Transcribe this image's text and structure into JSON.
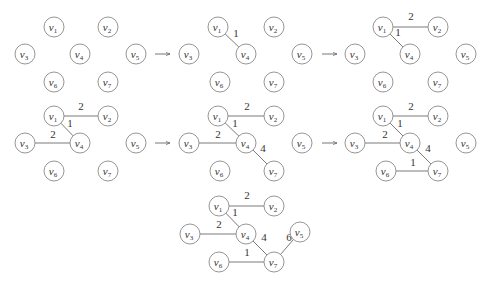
{
  "colors": {
    "node_stroke": "#8a8a8a",
    "edge": "#7a7a7a",
    "text": "#333333"
  },
  "node_radius": 10,
  "panels": [
    {
      "id": "step-1",
      "nodes": [
        {
          "id": "v1",
          "label": "v",
          "sub": "1",
          "x": 54,
          "y": 27
        },
        {
          "id": "v2",
          "label": "v",
          "sub": "2",
          "x": 108,
          "y": 27
        },
        {
          "id": "v3",
          "label": "v",
          "sub": "3",
          "x": 25,
          "y": 54
        },
        {
          "id": "v4",
          "label": "v",
          "sub": "4",
          "x": 80,
          "y": 54
        },
        {
          "id": "v5",
          "label": "v",
          "sub": "5",
          "x": 136,
          "y": 54
        },
        {
          "id": "v6",
          "label": "v",
          "sub": "6",
          "x": 54,
          "y": 82
        },
        {
          "id": "v7",
          "label": "v",
          "sub": "7",
          "x": 108,
          "y": 82
        }
      ],
      "edges": []
    },
    {
      "id": "step-2",
      "nodes": [
        {
          "id": "v1",
          "label": "v",
          "sub": "1",
          "x": 218,
          "y": 27
        },
        {
          "id": "v2",
          "label": "v",
          "sub": "2",
          "x": 274,
          "y": 27
        },
        {
          "id": "v3",
          "label": "v",
          "sub": "3",
          "x": 189,
          "y": 54
        },
        {
          "id": "v4",
          "label": "v",
          "sub": "4",
          "x": 246,
          "y": 54
        },
        {
          "id": "v5",
          "label": "v",
          "sub": "5",
          "x": 302,
          "y": 54
        },
        {
          "id": "v6",
          "label": "v",
          "sub": "6",
          "x": 220,
          "y": 82
        },
        {
          "id": "v7",
          "label": "v",
          "sub": "7",
          "x": 274,
          "y": 82
        }
      ],
      "edges": [
        {
          "from": "v1",
          "to": "v4",
          "weight": "1",
          "lx": 236,
          "ly": 37
        }
      ]
    },
    {
      "id": "step-3",
      "nodes": [
        {
          "id": "v1",
          "label": "v",
          "sub": "1",
          "x": 383,
          "y": 27
        },
        {
          "id": "v2",
          "label": "v",
          "sub": "2",
          "x": 438,
          "y": 27
        },
        {
          "id": "v3",
          "label": "v",
          "sub": "3",
          "x": 355,
          "y": 54
        },
        {
          "id": "v4",
          "label": "v",
          "sub": "4",
          "x": 410,
          "y": 54
        },
        {
          "id": "v5",
          "label": "v",
          "sub": "5",
          "x": 466,
          "y": 54
        },
        {
          "id": "v6",
          "label": "v",
          "sub": "6",
          "x": 383,
          "y": 82
        },
        {
          "id": "v7",
          "label": "v",
          "sub": "7",
          "x": 438,
          "y": 82
        }
      ],
      "edges": [
        {
          "from": "v1",
          "to": "v2",
          "weight": "2",
          "lx": 411,
          "ly": 20
        },
        {
          "from": "v1",
          "to": "v4",
          "weight": "1",
          "lx": 398,
          "ly": 36
        }
      ]
    },
    {
      "id": "step-4",
      "nodes": [
        {
          "id": "v1",
          "label": "v",
          "sub": "1",
          "x": 54,
          "y": 116
        },
        {
          "id": "v2",
          "label": "v",
          "sub": "2",
          "x": 108,
          "y": 116
        },
        {
          "id": "v3",
          "label": "v",
          "sub": "3",
          "x": 25,
          "y": 143
        },
        {
          "id": "v4",
          "label": "v",
          "sub": "4",
          "x": 80,
          "y": 143
        },
        {
          "id": "v5",
          "label": "v",
          "sub": "5",
          "x": 136,
          "y": 143
        },
        {
          "id": "v6",
          "label": "v",
          "sub": "6",
          "x": 54,
          "y": 171
        },
        {
          "id": "v7",
          "label": "v",
          "sub": "7",
          "x": 108,
          "y": 171
        }
      ],
      "edges": [
        {
          "from": "v1",
          "to": "v2",
          "weight": "2",
          "lx": 81,
          "ly": 110
        },
        {
          "from": "v1",
          "to": "v4",
          "weight": "1",
          "lx": 70,
          "ly": 127
        },
        {
          "from": "v3",
          "to": "v4",
          "weight": "2",
          "lx": 53,
          "ly": 138
        }
      ]
    },
    {
      "id": "step-5",
      "nodes": [
        {
          "id": "v1",
          "label": "v",
          "sub": "1",
          "x": 218,
          "y": 116
        },
        {
          "id": "v2",
          "label": "v",
          "sub": "2",
          "x": 274,
          "y": 116
        },
        {
          "id": "v3",
          "label": "v",
          "sub": "3",
          "x": 189,
          "y": 143
        },
        {
          "id": "v4",
          "label": "v",
          "sub": "4",
          "x": 246,
          "y": 143
        },
        {
          "id": "v5",
          "label": "v",
          "sub": "5",
          "x": 302,
          "y": 143
        },
        {
          "id": "v6",
          "label": "v",
          "sub": "6",
          "x": 220,
          "y": 171
        },
        {
          "id": "v7",
          "label": "v",
          "sub": "7",
          "x": 274,
          "y": 171
        }
      ],
      "edges": [
        {
          "from": "v1",
          "to": "v2",
          "weight": "2",
          "lx": 247,
          "ly": 110
        },
        {
          "from": "v1",
          "to": "v4",
          "weight": "1",
          "lx": 235,
          "ly": 127
        },
        {
          "from": "v3",
          "to": "v4",
          "weight": "2",
          "lx": 218,
          "ly": 138
        },
        {
          "from": "v4",
          "to": "v7",
          "weight": "4",
          "lx": 263,
          "ly": 152
        }
      ]
    },
    {
      "id": "step-6",
      "nodes": [
        {
          "id": "v1",
          "label": "v",
          "sub": "1",
          "x": 383,
          "y": 116
        },
        {
          "id": "v2",
          "label": "v",
          "sub": "2",
          "x": 438,
          "y": 116
        },
        {
          "id": "v3",
          "label": "v",
          "sub": "3",
          "x": 355,
          "y": 143
        },
        {
          "id": "v4",
          "label": "v",
          "sub": "4",
          "x": 410,
          "y": 143
        },
        {
          "id": "v5",
          "label": "v",
          "sub": "5",
          "x": 466,
          "y": 143
        },
        {
          "id": "v6",
          "label": "v",
          "sub": "6",
          "x": 386,
          "y": 171
        },
        {
          "id": "v7",
          "label": "v",
          "sub": "7",
          "x": 438,
          "y": 171
        }
      ],
      "edges": [
        {
          "from": "v1",
          "to": "v2",
          "weight": "2",
          "lx": 411,
          "ly": 110
        },
        {
          "from": "v1",
          "to": "v4",
          "weight": "1",
          "lx": 400,
          "ly": 127
        },
        {
          "from": "v3",
          "to": "v4",
          "weight": "2",
          "lx": 385,
          "ly": 138
        },
        {
          "from": "v4",
          "to": "v7",
          "weight": "4",
          "lx": 428,
          "ly": 152
        },
        {
          "from": "v6",
          "to": "v7",
          "weight": "1",
          "lx": 413,
          "ly": 166
        }
      ]
    },
    {
      "id": "step-7",
      "nodes": [
        {
          "id": "v1",
          "label": "v",
          "sub": "1",
          "x": 219,
          "y": 206
        },
        {
          "id": "v2",
          "label": "v",
          "sub": "2",
          "x": 274,
          "y": 206
        },
        {
          "id": "v3",
          "label": "v",
          "sub": "3",
          "x": 190,
          "y": 234
        },
        {
          "id": "v4",
          "label": "v",
          "sub": "4",
          "x": 246,
          "y": 234
        },
        {
          "id": "v5",
          "label": "v",
          "sub": "5",
          "x": 300,
          "y": 232
        },
        {
          "id": "v6",
          "label": "v",
          "sub": "6",
          "x": 219,
          "y": 262
        },
        {
          "id": "v7",
          "label": "v",
          "sub": "7",
          "x": 274,
          "y": 262
        }
      ],
      "edges": [
        {
          "from": "v1",
          "to": "v2",
          "weight": "2",
          "lx": 247,
          "ly": 199
        },
        {
          "from": "v1",
          "to": "v4",
          "weight": "1",
          "lx": 235,
          "ly": 216
        },
        {
          "from": "v3",
          "to": "v4",
          "weight": "2",
          "lx": 219,
          "ly": 228
        },
        {
          "from": "v4",
          "to": "v7",
          "weight": "4",
          "lx": 264,
          "ly": 241
        },
        {
          "from": "v5",
          "to": "v7",
          "weight": "6",
          "lx": 289,
          "ly": 241
        },
        {
          "from": "v6",
          "to": "v7",
          "weight": "1",
          "lx": 247,
          "ly": 256
        }
      ]
    }
  ],
  "arrows": [
    {
      "id": "arrow-1-2",
      "x1": 155,
      "y1": 54,
      "x2": 170,
      "y2": 54
    },
    {
      "id": "arrow-2-3",
      "x1": 322,
      "y1": 54,
      "x2": 337,
      "y2": 54
    },
    {
      "id": "arrow-4-5",
      "x1": 155,
      "y1": 143,
      "x2": 170,
      "y2": 143
    },
    {
      "id": "arrow-5-6",
      "x1": 322,
      "y1": 143,
      "x2": 337,
      "y2": 143
    }
  ]
}
